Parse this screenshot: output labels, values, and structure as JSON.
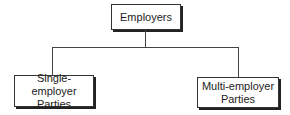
{
  "diagram": {
    "type": "hierarchy",
    "root": {
      "label": "Employers"
    },
    "children": [
      {
        "label_line1": "Single-employer",
        "label_line2": "Parties"
      },
      {
        "label_line1": "Multi-employer",
        "label_line2": "Parties"
      }
    ]
  }
}
